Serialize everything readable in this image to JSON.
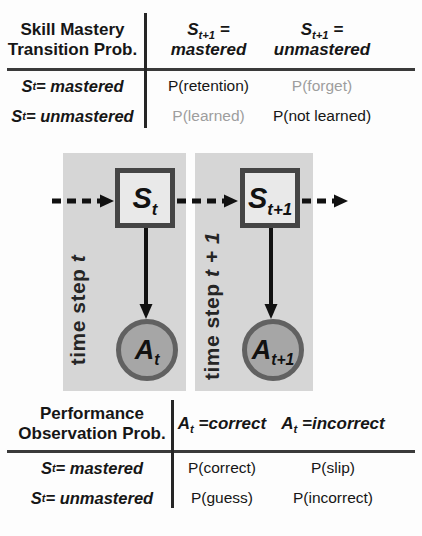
{
  "transition_table": {
    "corner_line1": "Skill Mastery",
    "corner_line2": "Transition Prob.",
    "col_headers": [
      {
        "base": "S",
        "sub": "t+1",
        "eq": " =",
        "value": "mastered"
      },
      {
        "base": "S",
        "sub": "t+1",
        "eq": " =",
        "value": "unmastered"
      }
    ],
    "rows": [
      {
        "base": "S",
        "sub": "t",
        "rest": "= mastered",
        "cells": [
          {
            "text": "P(retention)",
            "muted": false
          },
          {
            "text": "P(forget)",
            "muted": true
          }
        ]
      },
      {
        "base": "S",
        "sub": "t",
        "rest": "= unmastered",
        "cells": [
          {
            "text": "P(learned)",
            "muted": true
          },
          {
            "text": "P(not learned)",
            "muted": false
          }
        ]
      }
    ]
  },
  "observation_table": {
    "corner_line1": "Performance",
    "corner_line2": "Observation Prob.",
    "col_headers": [
      {
        "base": "A",
        "sub": "t",
        "eq": " =",
        "value": "correct"
      },
      {
        "base": "A",
        "sub": "t",
        "eq": " =",
        "value": "incorrect"
      }
    ],
    "rows": [
      {
        "base": "S",
        "sub": "t",
        "rest": "= mastered",
        "cells": [
          {
            "text": "P(correct)",
            "muted": false
          },
          {
            "text": "P(slip)",
            "muted": false
          }
        ]
      },
      {
        "base": "S",
        "sub": "t",
        "rest": "= unmastered",
        "cells": [
          {
            "text": "P(guess)",
            "muted": false
          },
          {
            "text": "P(incorrect)",
            "muted": false
          }
        ]
      }
    ]
  },
  "diagram": {
    "time_labels": [
      {
        "prefix": "time step ",
        "var": "t"
      },
      {
        "prefix": "time step ",
        "var": "t + 1"
      }
    ],
    "state_nodes": [
      {
        "base": "S",
        "sub": "t"
      },
      {
        "base": "S",
        "sub": "t+1"
      }
    ],
    "obs_nodes": [
      {
        "base": "A",
        "sub": "t"
      },
      {
        "base": "A",
        "sub": "t+1"
      }
    ]
  },
  "colors": {
    "panel": "#d6d6d6",
    "square_fill": "#e9e9e9",
    "square_border": "#454545",
    "circle_fill": "#a6a6a6",
    "circle_border": "#616161",
    "muted_text": "#9e9e9e",
    "text": "#161616",
    "arrow": "#111111"
  }
}
